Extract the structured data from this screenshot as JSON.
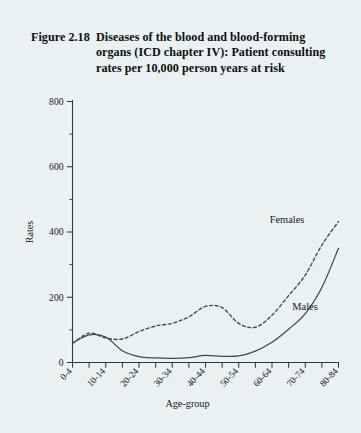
{
  "figure": {
    "label": "Figure 2.18",
    "caption": "Diseases of the blood and blood-forming organs (ICD chapter IV): Patient consulting rates per 10,000 person years at risk",
    "background_color": "#e9f1f2",
    "ink_color": "#2d3840"
  },
  "chart_data": {
    "type": "line",
    "xlabel": "Age-group",
    "ylabel": "Rates",
    "ylim": [
      0,
      800
    ],
    "yticks": [
      0,
      200,
      400,
      600,
      800
    ],
    "ytick_labels": [
      "0",
      "200",
      "400",
      "600",
      "800"
    ],
    "yminor_step": 100,
    "grid": false,
    "legend": "inline-labels",
    "categories": [
      "0-4",
      "5-9",
      "10-14",
      "15-19",
      "20-24",
      "25-29",
      "30-34",
      "35-39",
      "40-44",
      "45-49",
      "50-54",
      "55-59",
      "60-64",
      "65-69",
      "70-74",
      "75-79",
      "80-84"
    ],
    "xtick_labels_shown": [
      "0-4",
      "10-14",
      "20-24",
      "30-34",
      "40-44",
      "50-54",
      "60-64",
      "70-74",
      "80-84"
    ],
    "series": [
      {
        "name": "Males",
        "style": "solid",
        "values": [
          60,
          85,
          78,
          36,
          18,
          14,
          13,
          15,
          22,
          19,
          20,
          35,
          62,
          102,
          150,
          230,
          350
        ]
      },
      {
        "name": "Females",
        "style": "dashed",
        "values": [
          58,
          90,
          75,
          72,
          95,
          112,
          120,
          140,
          172,
          168,
          120,
          108,
          145,
          205,
          268,
          360,
          432
        ]
      }
    ]
  },
  "annotations": {
    "females_label": "Females",
    "males_label": "Males"
  }
}
